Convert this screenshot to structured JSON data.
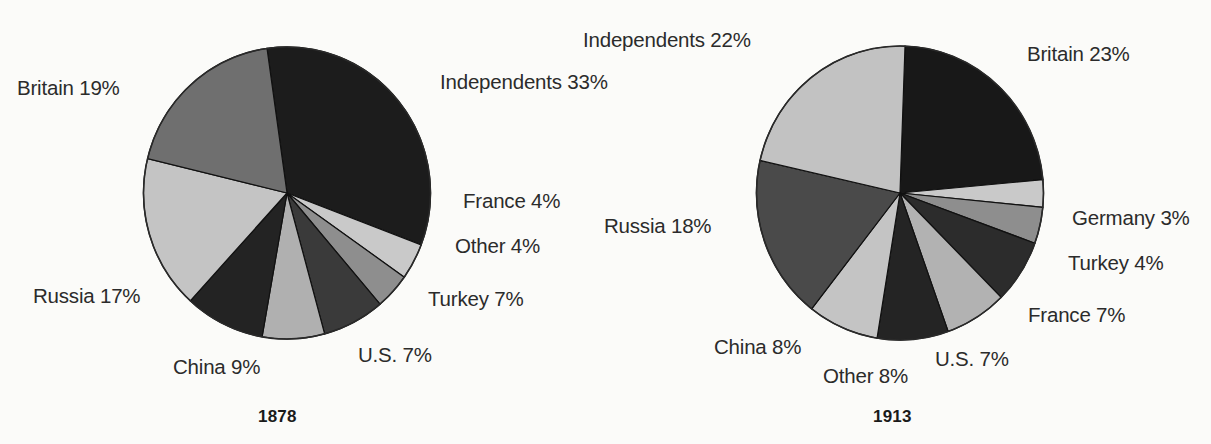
{
  "chart_data": [
    {
      "type": "pie",
      "title": "1878",
      "categories": [
        "Independents",
        "France",
        "Other",
        "Turkey",
        "U.S.",
        "China",
        "Russia",
        "Britain"
      ],
      "values": [
        33,
        4,
        4,
        7,
        7,
        9,
        17,
        19
      ],
      "labels": [
        "Independents 33%",
        "France 4%",
        "Other 4%",
        "Turkey 7%",
        "U.S. 7%",
        "China 9%",
        "Russia 17%",
        "Britain 19%"
      ],
      "unit": "%",
      "legend": "none",
      "colors": [
        "#1c1c1c",
        "#c9c9c9",
        "#8e8e8e",
        "#3a3a3a",
        "#b0b0b0",
        "#232323",
        "#c4c4c4",
        "#6f6f6f"
      ],
      "start_angle_deg": -8,
      "direction": "clockwise"
    },
    {
      "type": "pie",
      "title": "1913",
      "categories": [
        "Britain",
        "Germany",
        "Turkey",
        "France",
        "U.S.",
        "Other",
        "China",
        "Russia",
        "Independents"
      ],
      "values": [
        23,
        3,
        4,
        7,
        7,
        8,
        8,
        18,
        22
      ],
      "labels": [
        "Britain 23%",
        "Germany 3%",
        "Turkey 4%",
        "France 7%",
        "U.S. 7%",
        "Other 8%",
        "China 8%",
        "Russia 18%",
        "Independents 22%"
      ],
      "unit": "%",
      "legend": "none",
      "colors": [
        "#181818",
        "#c9c9c9",
        "#8e8e8e",
        "#2c2c2c",
        "#b2b2b2",
        "#242424",
        "#c4c4c4",
        "#4a4a4a",
        "#c2c2c2"
      ],
      "start_angle_deg": 2,
      "direction": "clockwise"
    }
  ],
  "chart_1878": {
    "year": "1878",
    "labels": {
      "britain": "Britain 19%",
      "independents": "Independents 33%",
      "france": "France 4%",
      "other": "Other 4%",
      "turkey": "Turkey 7%",
      "us": "U.S. 7%",
      "china": "China 9%",
      "russia": "Russia 17%"
    }
  },
  "chart_1913": {
    "year": "1913",
    "labels": {
      "independents": "Independents 22%",
      "britain": "Britain 23%",
      "germany": "Germany 3%",
      "turkey": "Turkey 4%",
      "france": "France 7%",
      "us": "U.S. 7%",
      "other": "Other 8%",
      "china": "China 8%",
      "russia": "Russia 18%"
    }
  }
}
